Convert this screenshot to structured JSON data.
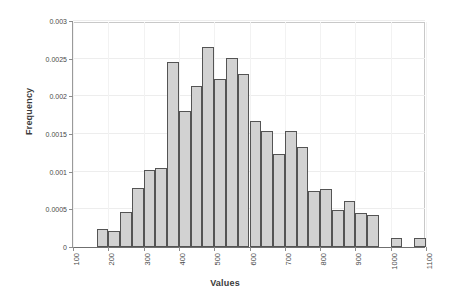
{
  "chart_data": {
    "type": "bar",
    "title": "",
    "subtitle": "",
    "xlabel": "Values",
    "ylabel": "Frequency",
    "xlim": [
      100,
      1100
    ],
    "ylim": [
      0,
      0.003
    ],
    "grid": true,
    "legend": null,
    "bin_width": 33.3,
    "xtick_labels": [
      "100",
      "200",
      "300",
      "400",
      "500",
      "600",
      "700",
      "800",
      "900",
      "1000",
      "1100"
    ],
    "xtick_values": [
      100,
      200,
      300,
      400,
      500,
      600,
      700,
      800,
      900,
      1000,
      1100
    ],
    "ytick_labels": [
      "0",
      "0.0005",
      "0.001",
      "0.0015",
      "0.002",
      "0.0025",
      "0.003"
    ],
    "ytick_values": [
      0,
      0.0005,
      0.001,
      0.0015,
      0.002,
      0.0025,
      0.003
    ],
    "bin_edges": [
      166.7,
      200.0,
      233.3,
      266.7,
      300.0,
      333.3,
      366.7,
      400.0,
      433.3,
      466.7,
      500.0,
      533.3,
      566.7,
      600.0,
      633.3,
      666.7,
      700.0,
      733.3,
      766.7,
      800.0,
      833.3,
      866.7,
      900.0,
      933.3,
      966.7,
      1000.0,
      1033.3,
      1066.7,
      1100.0
    ],
    "categories": [
      "167-200",
      "200-233",
      "233-267",
      "267-300",
      "300-333",
      "333-367",
      "367-400",
      "400-433",
      "433-467",
      "467-500",
      "500-533",
      "533-567",
      "567-600",
      "600-633",
      "633-667",
      "667-700",
      "700-733",
      "733-767",
      "767-800",
      "800-833",
      "833-867",
      "867-900",
      "900-933",
      "933-967",
      "967-1000",
      "1000-1033",
      "1033-1067",
      "1067-1100"
    ],
    "values": [
      0.00024,
      0.00021,
      0.00046,
      0.00078,
      0.00102,
      0.00105,
      0.00246,
      0.0018,
      0.00214,
      0.00266,
      0.00223,
      0.00251,
      0.0023,
      0.00167,
      0.00154,
      0.00123,
      0.00154,
      0.00133,
      0.00074,
      0.00077,
      0.00049,
      0.00061,
      0.00045,
      0.00043,
      0.0,
      0.00012,
      0.0,
      0.00012
    ],
    "colors": {
      "bar_fill": "#d2d2d2",
      "bar_edge": "#545454",
      "grid": "#ededed",
      "axis": "#6f6f6f",
      "text": "#3b3b3b",
      "background": "#ffffff"
    }
  }
}
